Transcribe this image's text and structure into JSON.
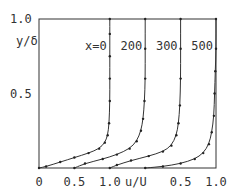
{
  "chart_data": {
    "type": "line",
    "title": "",
    "xlabel": "u/U",
    "ylabel": "y/δ",
    "x_offset_per_profile": 0.5,
    "xlim_global": [
      0,
      2.5
    ],
    "ylim": [
      0,
      1.0
    ],
    "x_tick_labels": [
      "0",
      "0.5",
      "1.0",
      "0.5",
      "1.0"
    ],
    "x_tick_positions_global": [
      0,
      0.5,
      1.0,
      2.0,
      2.5
    ],
    "y_tick_labels": [
      "0.5",
      "1.0"
    ],
    "y_ticks": [
      0.5,
      1.0
    ],
    "grid": false,
    "series": [
      {
        "name": "x=0",
        "label": "x=0",
        "offset": 0.0,
        "points": [
          [
            0,
            0
          ],
          [
            0.1,
            0.01
          ],
          [
            0.3,
            0.04
          ],
          [
            0.5,
            0.07
          ],
          [
            0.7,
            0.1
          ],
          [
            0.85,
            0.13
          ],
          [
            0.93,
            0.17
          ],
          [
            0.97,
            0.22
          ],
          [
            0.99,
            0.3
          ],
          [
            1.0,
            0.45
          ],
          [
            1.0,
            0.6
          ],
          [
            1.0,
            0.75
          ],
          [
            1.0,
            0.9
          ],
          [
            1.0,
            1.0
          ]
        ]
      },
      {
        "name": "x=200",
        "label": "200",
        "offset": 0.5,
        "points": [
          [
            0,
            0
          ],
          [
            0.15,
            0.03
          ],
          [
            0.4,
            0.06
          ],
          [
            0.6,
            0.09
          ],
          [
            0.78,
            0.13
          ],
          [
            0.88,
            0.18
          ],
          [
            0.94,
            0.25
          ],
          [
            0.97,
            0.33
          ],
          [
            0.99,
            0.45
          ],
          [
            1.0,
            0.6
          ],
          [
            1.0,
            0.8
          ],
          [
            1.0,
            1.0
          ]
        ]
      },
      {
        "name": "x=300",
        "label": "300",
        "offset": 1.0,
        "points": [
          [
            0,
            0
          ],
          [
            0.1,
            0.02
          ],
          [
            0.3,
            0.05
          ],
          [
            0.55,
            0.08
          ],
          [
            0.75,
            0.11
          ],
          [
            0.87,
            0.15
          ],
          [
            0.94,
            0.22
          ],
          [
            0.97,
            0.3
          ],
          [
            0.99,
            0.42
          ],
          [
            1.0,
            0.6
          ],
          [
            1.0,
            0.8
          ],
          [
            1.0,
            1.0
          ]
        ]
      },
      {
        "name": "x=500",
        "label": "500",
        "offset": 1.5,
        "points": [
          [
            0,
            0
          ],
          [
            0.25,
            0.01
          ],
          [
            0.5,
            0.03
          ],
          [
            0.7,
            0.06
          ],
          [
            0.82,
            0.1
          ],
          [
            0.9,
            0.16
          ],
          [
            0.94,
            0.24
          ],
          [
            0.97,
            0.35
          ],
          [
            0.98,
            0.5
          ],
          [
            0.99,
            0.65
          ],
          [
            1.0,
            0.8
          ],
          [
            1.0,
            1.0
          ]
        ]
      }
    ]
  }
}
